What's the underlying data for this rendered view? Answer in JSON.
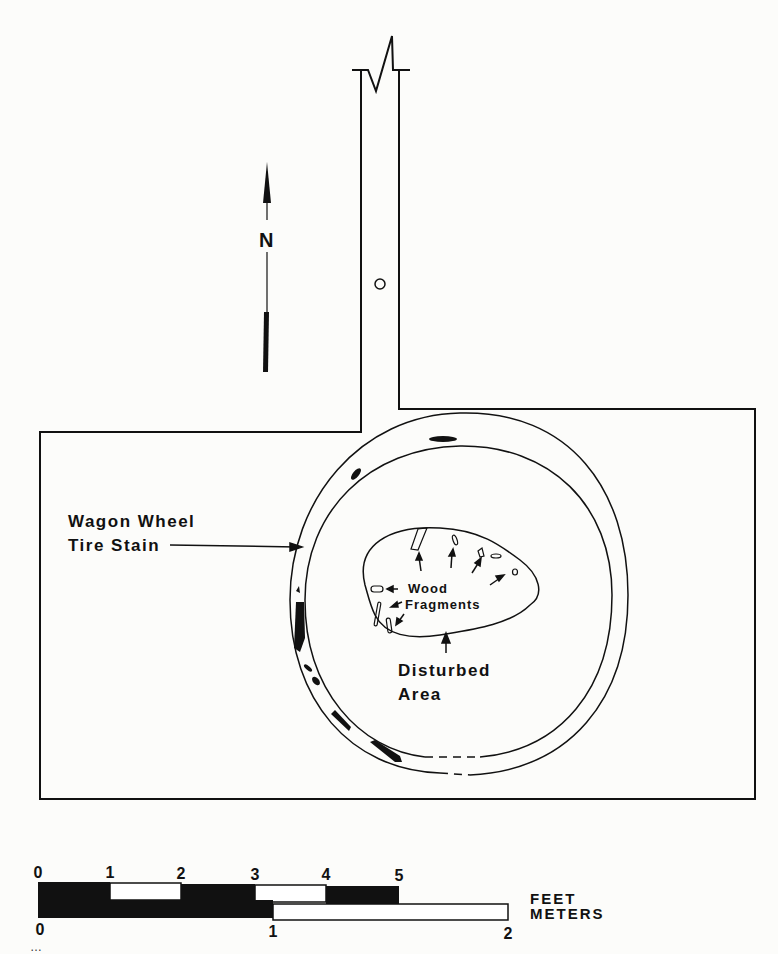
{
  "figure": {
    "type": "archaeological-plan-map",
    "colors": {
      "ink": "#111111",
      "paper": "#fcfcfa"
    }
  },
  "north_arrow": {
    "label": "N"
  },
  "labels": {
    "tire_stain_line1": "Wagon Wheel",
    "tire_stain_line2": "Tire Stain",
    "wood_line1": "Wood",
    "wood_line2": "Fragments",
    "disturbed_line1": "Disturbed",
    "disturbed_line2": "Area"
  },
  "scale_bar": {
    "feet_ticks": [
      "0",
      "1",
      "2",
      "3",
      "4",
      "5"
    ],
    "meter_ticks": [
      "0",
      "1",
      "2"
    ],
    "feet_label": "FEET",
    "meters_label": "METERS"
  },
  "caption_fragment": "…"
}
